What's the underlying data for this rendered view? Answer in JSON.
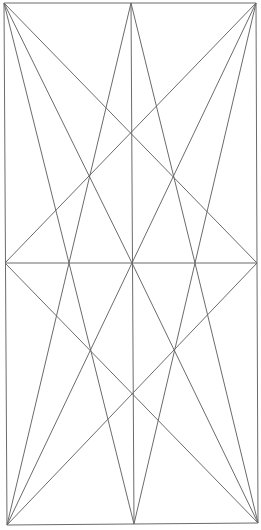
{
  "diagram": {
    "width": 261,
    "height": 530,
    "stroke_color": "#6b6b6b",
    "background": "#ffffff",
    "points": {
      "top_left": [
        4,
        3
      ],
      "top_center": [
        131,
        3
      ],
      "top_right": [
        256,
        3
      ],
      "mid_left": [
        5,
        263
      ],
      "mid_q1": [
        69,
        263
      ],
      "mid_center": [
        132,
        263
      ],
      "mid_q3": [
        195,
        263
      ],
      "mid_right": [
        257,
        263
      ],
      "bottom_left": [
        7,
        525
      ],
      "bottom_center": [
        134,
        524
      ],
      "bottom_right": [
        258,
        523
      ]
    },
    "segments": [
      {
        "name": "border-top",
        "from": "top_left",
        "to": "top_right"
      },
      {
        "name": "border-left",
        "from": "top_left",
        "to": "bottom_left"
      },
      {
        "name": "border-right",
        "from": "top_right",
        "to": "bottom_right"
      },
      {
        "name": "border-bottom",
        "from": "bottom_left",
        "to": "bottom_right"
      },
      {
        "name": "midline-horizontal",
        "from": "mid_left",
        "to": "mid_right"
      },
      {
        "name": "centerline-vertical",
        "from": "top_center",
        "to": "bottom_center"
      },
      {
        "name": "tl-to-mid-q1",
        "from": "top_left",
        "to": "mid_q1"
      },
      {
        "name": "tl-to-mid-center",
        "from": "top_left",
        "to": "mid_center"
      },
      {
        "name": "tl-to-mid-right",
        "from": "top_left",
        "to": "mid_right"
      },
      {
        "name": "tr-to-mid-q3",
        "from": "top_right",
        "to": "mid_q3"
      },
      {
        "name": "tr-to-mid-center",
        "from": "top_right",
        "to": "mid_center"
      },
      {
        "name": "tr-to-mid-left",
        "from": "top_right",
        "to": "mid_left"
      },
      {
        "name": "tc-to-mid-q1",
        "from": "top_center",
        "to": "mid_q1"
      },
      {
        "name": "tc-to-mid-q3",
        "from": "top_center",
        "to": "mid_q3"
      },
      {
        "name": "bl-to-mid-q1",
        "from": "bottom_left",
        "to": "mid_q1"
      },
      {
        "name": "bl-to-mid-center",
        "from": "bottom_left",
        "to": "mid_center"
      },
      {
        "name": "bl-to-mid-right",
        "from": "bottom_left",
        "to": "mid_right"
      },
      {
        "name": "br-to-mid-q3",
        "from": "bottom_right",
        "to": "mid_q3"
      },
      {
        "name": "br-to-mid-center",
        "from": "bottom_right",
        "to": "mid_center"
      },
      {
        "name": "br-to-mid-left",
        "from": "bottom_right",
        "to": "mid_left"
      },
      {
        "name": "bc-to-mid-q1",
        "from": "bottom_center",
        "to": "mid_q1"
      },
      {
        "name": "bc-to-mid-q3",
        "from": "bottom_center",
        "to": "mid_q3"
      }
    ]
  }
}
